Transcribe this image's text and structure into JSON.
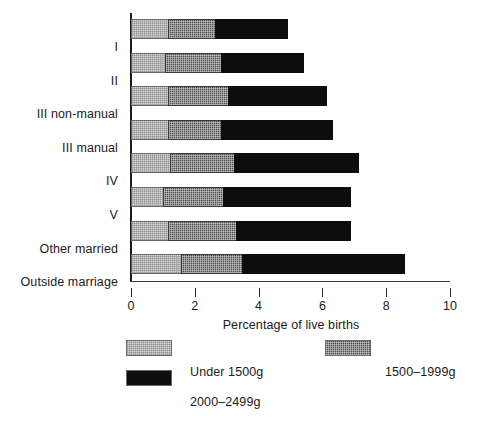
{
  "chart_data": {
    "type": "bar",
    "orientation": "horizontal",
    "stacked": true,
    "title": "",
    "xlabel": "Percentage of live births",
    "ylabel": "",
    "xlim": [
      0,
      10
    ],
    "xticks": [
      0,
      2,
      4,
      6,
      8,
      10
    ],
    "xtick_labels": [
      "0",
      "2",
      "4",
      "6",
      "8",
      "10"
    ],
    "grid": false,
    "legend_position": "below",
    "categories": [
      "I",
      "II",
      "III non-manual",
      "III manual",
      "IV",
      "V",
      "Other married",
      "Outside marriage"
    ],
    "series": [
      {
        "name": "Under 1500g",
        "color": "#d8d8d8",
        "values": [
          1.2,
          1.1,
          1.2,
          1.2,
          1.25,
          1.05,
          1.2,
          1.6
        ]
      },
      {
        "name": "1500-1999g",
        "color": "#4a4a4a",
        "values": [
          1.5,
          1.8,
          1.9,
          1.7,
          2.05,
          1.9,
          2.15,
          1.95
        ]
      },
      {
        "name": "2000-2499g",
        "color": "#0d0d0d",
        "values": [
          2.3,
          2.6,
          3.1,
          3.5,
          3.9,
          4.0,
          3.6,
          5.1
        ]
      }
    ],
    "totals": [
      5.0,
      5.5,
      6.2,
      6.4,
      7.2,
      6.95,
      6.95,
      8.65
    ]
  },
  "legend": {
    "items": [
      {
        "label": "Under 1500g",
        "swatch": "light"
      },
      {
        "label": "1500–1999g",
        "swatch": "mid"
      },
      {
        "label": "2000–2499g",
        "swatch": "dark"
      }
    ]
  },
  "axis": {
    "x_title": "Percentage of live births",
    "ticks": [
      "0",
      "2",
      "4",
      "6",
      "8",
      "10"
    ]
  }
}
